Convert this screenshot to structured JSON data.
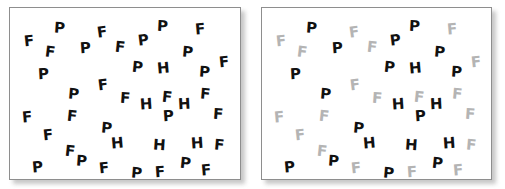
{
  "figure": {
    "background_color": "#ffffff",
    "panel_border_color": "#8e8e8e",
    "panel_fill_color": "#ffffff",
    "shadow_color": "#9a9a9a"
  },
  "colors": {
    "black": "#111111",
    "gray": "#b4b4b4"
  },
  "panels": [
    {
      "id": "left",
      "name": "conjunction-search-panel",
      "description": "All letters rendered in black",
      "x": 9,
      "y": 7,
      "width": 232,
      "height": 173,
      "letters": [
        {
          "ch": "F",
          "x": 14,
          "y": 26,
          "size": 15,
          "rot": -6,
          "color": "black"
        },
        {
          "ch": "P",
          "x": 44,
          "y": 13,
          "size": 15,
          "rot": 4,
          "color": "black"
        },
        {
          "ch": "F",
          "x": 87,
          "y": 17,
          "size": 15,
          "rot": -8,
          "color": "black"
        },
        {
          "ch": "P",
          "x": 147,
          "y": 11,
          "size": 15,
          "rot": 3,
          "color": "black"
        },
        {
          "ch": "F",
          "x": 185,
          "y": 14,
          "size": 15,
          "rot": -5,
          "color": "black"
        },
        {
          "ch": "F",
          "x": 35,
          "y": 37,
          "size": 15,
          "rot": 7,
          "color": "black"
        },
        {
          "ch": "P",
          "x": 70,
          "y": 33,
          "size": 15,
          "rot": -4,
          "color": "black"
        },
        {
          "ch": "F",
          "x": 105,
          "y": 32,
          "size": 15,
          "rot": 6,
          "color": "black"
        },
        {
          "ch": "P",
          "x": 128,
          "y": 25,
          "size": 15,
          "rot": -7,
          "color": "black"
        },
        {
          "ch": "P",
          "x": 172,
          "y": 37,
          "size": 15,
          "rot": 5,
          "color": "black"
        },
        {
          "ch": "P",
          "x": 28,
          "y": 59,
          "size": 15,
          "rot": -3,
          "color": "black"
        },
        {
          "ch": "P",
          "x": 122,
          "y": 52,
          "size": 15,
          "rot": 6,
          "color": "black"
        },
        {
          "ch": "H",
          "x": 147,
          "y": 53,
          "size": 15,
          "rot": -5,
          "color": "black"
        },
        {
          "ch": "P",
          "x": 189,
          "y": 57,
          "size": 15,
          "rot": 4,
          "color": "black"
        },
        {
          "ch": "F",
          "x": 209,
          "y": 47,
          "size": 15,
          "rot": -6,
          "color": "black"
        },
        {
          "ch": "P",
          "x": 58,
          "y": 79,
          "size": 15,
          "rot": 5,
          "color": "black"
        },
        {
          "ch": "F",
          "x": 88,
          "y": 70,
          "size": 15,
          "rot": -7,
          "color": "black"
        },
        {
          "ch": "F",
          "x": 110,
          "y": 83,
          "size": 15,
          "rot": 4,
          "color": "black"
        },
        {
          "ch": "H",
          "x": 130,
          "y": 89,
          "size": 15,
          "rot": -4,
          "color": "black"
        },
        {
          "ch": "F",
          "x": 152,
          "y": 82,
          "size": 15,
          "rot": 6,
          "color": "black"
        },
        {
          "ch": "H",
          "x": 168,
          "y": 89,
          "size": 15,
          "rot": -3,
          "color": "black"
        },
        {
          "ch": "F",
          "x": 190,
          "y": 79,
          "size": 15,
          "rot": 5,
          "color": "black"
        },
        {
          "ch": "F",
          "x": 12,
          "y": 102,
          "size": 15,
          "rot": -5,
          "color": "black"
        },
        {
          "ch": "F",
          "x": 57,
          "y": 101,
          "size": 15,
          "rot": 6,
          "color": "black"
        },
        {
          "ch": "P",
          "x": 153,
          "y": 101,
          "size": 15,
          "rot": -4,
          "color": "black"
        },
        {
          "ch": "F",
          "x": 203,
          "y": 99,
          "size": 15,
          "rot": 4,
          "color": "black"
        },
        {
          "ch": "F",
          "x": 33,
          "y": 120,
          "size": 15,
          "rot": -6,
          "color": "black"
        },
        {
          "ch": "P",
          "x": 91,
          "y": 113,
          "size": 15,
          "rot": 5,
          "color": "black"
        },
        {
          "ch": "H",
          "x": 101,
          "y": 128,
          "size": 15,
          "rot": -5,
          "color": "black"
        },
        {
          "ch": "H",
          "x": 143,
          "y": 130,
          "size": 15,
          "rot": 4,
          "color": "black"
        },
        {
          "ch": "H",
          "x": 181,
          "y": 128,
          "size": 15,
          "rot": -4,
          "color": "black"
        },
        {
          "ch": "F",
          "x": 204,
          "y": 130,
          "size": 15,
          "rot": 5,
          "color": "black"
        },
        {
          "ch": "F",
          "x": 55,
          "y": 136,
          "size": 15,
          "rot": 6,
          "color": "black"
        },
        {
          "ch": "P",
          "x": 22,
          "y": 152,
          "size": 15,
          "rot": -5,
          "color": "black"
        },
        {
          "ch": "P",
          "x": 66,
          "y": 146,
          "size": 15,
          "rot": 4,
          "color": "black"
        },
        {
          "ch": "F",
          "x": 89,
          "y": 153,
          "size": 15,
          "rot": -6,
          "color": "black"
        },
        {
          "ch": "P",
          "x": 121,
          "y": 158,
          "size": 15,
          "rot": 5,
          "color": "black"
        },
        {
          "ch": "F",
          "x": 145,
          "y": 157,
          "size": 15,
          "rot": -4,
          "color": "black"
        },
        {
          "ch": "P",
          "x": 170,
          "y": 148,
          "size": 15,
          "rot": 6,
          "color": "black"
        },
        {
          "ch": "F",
          "x": 191,
          "y": 155,
          "size": 15,
          "rot": -5,
          "color": "black"
        }
      ]
    },
    {
      "id": "right",
      "name": "feature-search-panel",
      "description": "F distractors rendered in gray, P and H rendered in black",
      "x": 261,
      "y": 7,
      "width": 231,
      "height": 173,
      "letters": [
        {
          "ch": "F",
          "x": 14,
          "y": 26,
          "size": 15,
          "rot": -6,
          "color": "gray"
        },
        {
          "ch": "P",
          "x": 44,
          "y": 13,
          "size": 15,
          "rot": 4,
          "color": "black"
        },
        {
          "ch": "F",
          "x": 87,
          "y": 17,
          "size": 15,
          "rot": -8,
          "color": "gray"
        },
        {
          "ch": "P",
          "x": 147,
          "y": 11,
          "size": 15,
          "rot": 3,
          "color": "black"
        },
        {
          "ch": "F",
          "x": 185,
          "y": 14,
          "size": 15,
          "rot": -5,
          "color": "gray"
        },
        {
          "ch": "F",
          "x": 35,
          "y": 37,
          "size": 15,
          "rot": 7,
          "color": "gray"
        },
        {
          "ch": "P",
          "x": 70,
          "y": 33,
          "size": 15,
          "rot": -4,
          "color": "black"
        },
        {
          "ch": "F",
          "x": 105,
          "y": 32,
          "size": 15,
          "rot": 6,
          "color": "gray"
        },
        {
          "ch": "P",
          "x": 128,
          "y": 25,
          "size": 15,
          "rot": -7,
          "color": "black"
        },
        {
          "ch": "P",
          "x": 172,
          "y": 37,
          "size": 15,
          "rot": 5,
          "color": "black"
        },
        {
          "ch": "P",
          "x": 28,
          "y": 59,
          "size": 15,
          "rot": -3,
          "color": "black"
        },
        {
          "ch": "P",
          "x": 122,
          "y": 52,
          "size": 15,
          "rot": 6,
          "color": "black"
        },
        {
          "ch": "H",
          "x": 147,
          "y": 53,
          "size": 15,
          "rot": -5,
          "color": "black"
        },
        {
          "ch": "P",
          "x": 189,
          "y": 57,
          "size": 15,
          "rot": 4,
          "color": "black"
        },
        {
          "ch": "F",
          "x": 209,
          "y": 47,
          "size": 15,
          "rot": -6,
          "color": "gray"
        },
        {
          "ch": "P",
          "x": 58,
          "y": 79,
          "size": 15,
          "rot": 5,
          "color": "black"
        },
        {
          "ch": "F",
          "x": 88,
          "y": 70,
          "size": 15,
          "rot": -7,
          "color": "gray"
        },
        {
          "ch": "F",
          "x": 110,
          "y": 83,
          "size": 15,
          "rot": 4,
          "color": "gray"
        },
        {
          "ch": "H",
          "x": 130,
          "y": 89,
          "size": 15,
          "rot": -4,
          "color": "black"
        },
        {
          "ch": "F",
          "x": 152,
          "y": 82,
          "size": 15,
          "rot": 6,
          "color": "gray"
        },
        {
          "ch": "H",
          "x": 168,
          "y": 89,
          "size": 15,
          "rot": -3,
          "color": "black"
        },
        {
          "ch": "F",
          "x": 190,
          "y": 79,
          "size": 15,
          "rot": 5,
          "color": "gray"
        },
        {
          "ch": "F",
          "x": 12,
          "y": 102,
          "size": 15,
          "rot": -5,
          "color": "gray"
        },
        {
          "ch": "F",
          "x": 57,
          "y": 101,
          "size": 15,
          "rot": 6,
          "color": "gray"
        },
        {
          "ch": "P",
          "x": 153,
          "y": 101,
          "size": 15,
          "rot": -4,
          "color": "black"
        },
        {
          "ch": "F",
          "x": 203,
          "y": 99,
          "size": 15,
          "rot": 4,
          "color": "gray"
        },
        {
          "ch": "F",
          "x": 33,
          "y": 120,
          "size": 15,
          "rot": -6,
          "color": "gray"
        },
        {
          "ch": "P",
          "x": 91,
          "y": 113,
          "size": 15,
          "rot": 5,
          "color": "black"
        },
        {
          "ch": "H",
          "x": 101,
          "y": 128,
          "size": 15,
          "rot": -5,
          "color": "black"
        },
        {
          "ch": "H",
          "x": 143,
          "y": 130,
          "size": 15,
          "rot": 4,
          "color": "black"
        },
        {
          "ch": "H",
          "x": 181,
          "y": 128,
          "size": 15,
          "rot": -4,
          "color": "black"
        },
        {
          "ch": "F",
          "x": 204,
          "y": 130,
          "size": 15,
          "rot": 5,
          "color": "gray"
        },
        {
          "ch": "F",
          "x": 55,
          "y": 136,
          "size": 15,
          "rot": 6,
          "color": "gray"
        },
        {
          "ch": "P",
          "x": 22,
          "y": 152,
          "size": 15,
          "rot": -5,
          "color": "black"
        },
        {
          "ch": "P",
          "x": 66,
          "y": 146,
          "size": 15,
          "rot": 4,
          "color": "black"
        },
        {
          "ch": "F",
          "x": 89,
          "y": 153,
          "size": 15,
          "rot": -6,
          "color": "gray"
        },
        {
          "ch": "P",
          "x": 121,
          "y": 158,
          "size": 15,
          "rot": 5,
          "color": "black"
        },
        {
          "ch": "F",
          "x": 145,
          "y": 157,
          "size": 15,
          "rot": -4,
          "color": "gray"
        },
        {
          "ch": "P",
          "x": 170,
          "y": 148,
          "size": 15,
          "rot": 6,
          "color": "black"
        },
        {
          "ch": "F",
          "x": 191,
          "y": 155,
          "size": 15,
          "rot": -5,
          "color": "gray"
        }
      ]
    }
  ]
}
